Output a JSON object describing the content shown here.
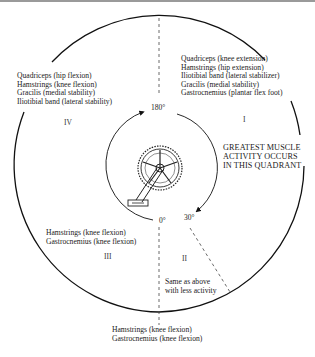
{
  "quadrants": {
    "IV": {
      "numeral": "IV",
      "muscles": [
        "Quadriceps (hip flexion)",
        "Hamstrings (knee flexion)",
        "Gracilis (medial stability)",
        "Iliotibial band (lateral stability)"
      ]
    },
    "I": {
      "numeral": "I",
      "muscles": [
        "Quadriceps (knee extension)",
        "Hamstrings (hip extension)",
        "Iliotibial band (lateral stabilizer)",
        "Gracilis (medial stability)",
        "Gastrocnemius (plantar flex foot)"
      ],
      "callout": [
        "GREATEST MUSCLE",
        "ACTIVITY OCCURS",
        "IN THIS QUADRANT"
      ]
    },
    "III": {
      "numeral": "III",
      "muscles": [
        "Hamstrings (knee flexion)",
        "Gastrocnemius (knee flexion)"
      ]
    },
    "II": {
      "numeral": "II",
      "muscles": [
        "Same as above",
        "with less activity"
      ]
    }
  },
  "angles": {
    "top": "180°",
    "bottom": "0°",
    "offset": "30°"
  },
  "bottom_note": [
    "Hamstrings (knee flexion)",
    "Gastrocnemius (knee flexion)"
  ],
  "illustration": "bicycle-crankset"
}
